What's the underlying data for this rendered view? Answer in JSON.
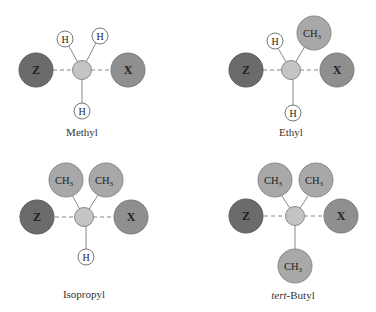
{
  "colors": {
    "z": "#6b6b6b",
    "x": "#8f8f8f",
    "ch3": "#a8a8a8",
    "center": "#c4c4c4",
    "h": "#ffffff",
    "stroke": "#7a7a7a"
  },
  "panels": [
    {
      "name": "Methyl",
      "label": "Methyl",
      "z": "Z",
      "x": "X",
      "groups": [
        "H",
        "H",
        "H"
      ]
    },
    {
      "name": "Ethyl",
      "label": "Ethyl",
      "z": "Z",
      "x": "X",
      "groups": [
        "H",
        "CH3",
        "H"
      ]
    },
    {
      "name": "Isopropyl",
      "label": "Isopropyl",
      "z": "Z",
      "x": "X",
      "groups": [
        "CH3",
        "CH3",
        "H"
      ]
    },
    {
      "name": "tert-Butyl",
      "label_prefix": "tert",
      "label_suffix": "-Butyl",
      "z": "Z",
      "x": "X",
      "groups": [
        "CH3",
        "CH3",
        "CH3"
      ]
    }
  ],
  "text": {
    "z": "Z",
    "x": "X",
    "h": "H",
    "ch": "CH",
    "sub3": "3"
  }
}
